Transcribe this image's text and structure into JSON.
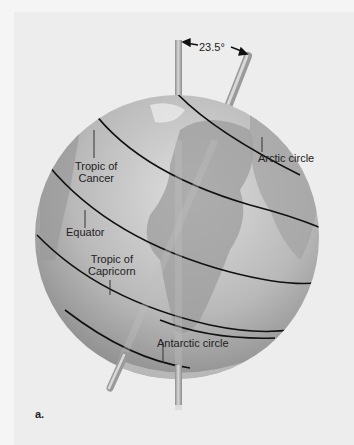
{
  "figure": {
    "panel_letter": "a.",
    "tilt_angle_label": "23.5°",
    "labels": {
      "arctic_circle": "Arctic circle",
      "tropic_of_cancer_line1": "Tropic of",
      "tropic_of_cancer_line2": "Cancer",
      "equator": "Equator",
      "tropic_of_capricorn_line1": "Tropic of",
      "tropic_of_capricorn_line2": "Capricorn",
      "antarctic_circle": "Antarctic circle"
    },
    "colors": {
      "background": "#ededed",
      "globe_light": "#d6d6d6",
      "globe_dark": "#8e8e8e",
      "latitude_line": "#111111",
      "axis_rod": "#a8a8a8"
    }
  }
}
